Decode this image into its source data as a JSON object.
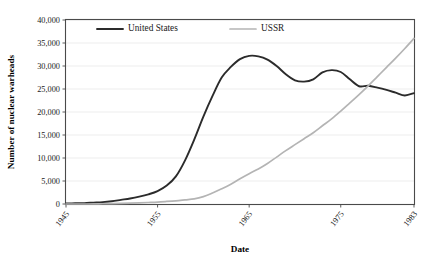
{
  "chart_data": {
    "type": "line",
    "title": "",
    "xlabel": "Date",
    "ylabel": "Number of nuclear warheads",
    "xlim": [
      1945,
      1983
    ],
    "ylim": [
      0,
      40000
    ],
    "grid": true,
    "legend_position": "top-left-inside",
    "xticks": [
      "1945",
      "1955",
      "1965",
      "1975",
      "1983"
    ],
    "xtick_values": [
      1945,
      1955,
      1965,
      1975,
      1983
    ],
    "yticks": [
      "0",
      "5,000",
      "10,000",
      "15,000",
      "20,000",
      "25,000",
      "30,000",
      "35,000",
      "40,000"
    ],
    "ytick_values": [
      0,
      5000,
      10000,
      15000,
      20000,
      25000,
      30000,
      35000,
      40000
    ],
    "x": [
      1945,
      1946,
      1947,
      1948,
      1949,
      1950,
      1951,
      1952,
      1953,
      1954,
      1955,
      1956,
      1957,
      1958,
      1959,
      1960,
      1961,
      1962,
      1963,
      1964,
      1965,
      1966,
      1967,
      1968,
      1969,
      1970,
      1971,
      1972,
      1973,
      1974,
      1975,
      1976,
      1977,
      1978,
      1979,
      1980,
      1981,
      1982,
      1983
    ],
    "series": [
      {
        "name": "United States",
        "color": "#2b2b2b",
        "values": [
          100,
          150,
          200,
          300,
          400,
          600,
          900,
          1200,
          1600,
          2100,
          2800,
          4000,
          6000,
          9500,
          14000,
          19000,
          23500,
          27500,
          29800,
          31500,
          32200,
          32100,
          31400,
          30000,
          28200,
          26900,
          26600,
          27100,
          28600,
          29100,
          28700,
          27100,
          25600,
          25700,
          25300,
          24800,
          24200,
          23600,
          24100
        ]
      },
      {
        "name": "USSR",
        "color": "#b4b4b4",
        "values": [
          0,
          0,
          0,
          0,
          50,
          80,
          120,
          180,
          250,
          330,
          420,
          550,
          700,
          900,
          1100,
          1600,
          2400,
          3300,
          4300,
          5500,
          6600,
          7600,
          8800,
          10200,
          11600,
          12900,
          14200,
          15500,
          17000,
          18500,
          20200,
          22000,
          23800,
          25700,
          27700,
          29700,
          31700,
          33800,
          36000
        ]
      }
    ]
  },
  "legend": {
    "entries": [
      {
        "label": "United States",
        "color": "#2b2b2b"
      },
      {
        "label": "USSR",
        "color": "#b4b4b4"
      }
    ]
  },
  "axes": {
    "x_title": "Date",
    "y_title": "Number of nuclear warheads"
  }
}
